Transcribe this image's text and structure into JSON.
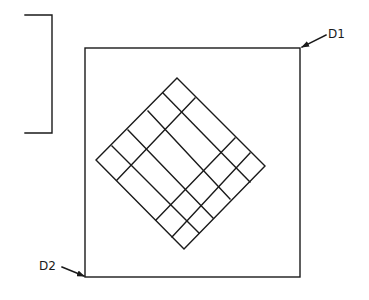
{
  "diagram": {
    "type": "technical-drawing",
    "labels": {
      "d1": "D1",
      "d2": "D2"
    },
    "stroke_color": "#1a1a1a",
    "background": "#ffffff",
    "bracket": {
      "top_y": 15,
      "bottom_y": 133,
      "x": 52,
      "left_x": 25
    },
    "frame": {
      "x": 85,
      "y": 48,
      "width": 215,
      "height": 229
    },
    "diamond": {
      "top": [
        177,
        78
      ],
      "right": [
        265,
        166
      ],
      "bottom": [
        184,
        249
      ],
      "left": [
        96,
        160
      ],
      "down_right_lines": [
        [
          [
            163,
            93
          ],
          [
            250,
            182
          ]
        ],
        [
          [
            148,
            111
          ],
          [
            230,
            199
          ]
        ],
        [
          [
            128,
            130
          ],
          [
            213,
            218
          ]
        ],
        [
          [
            112,
            146
          ],
          [
            199,
            233
          ]
        ]
      ],
      "up_right_lines": [
        [
          [
            117,
            180
          ],
          [
            195,
            98
          ]
        ],
        [
          [
            156,
            220
          ],
          [
            235,
            138
          ]
        ],
        [
          [
            172,
            237
          ],
          [
            250,
            153
          ]
        ]
      ]
    },
    "leaders": [
      {
        "label": "D1",
        "from": [
          326,
          35
        ],
        "to": [
          301,
          48
        ]
      },
      {
        "label": "D2",
        "from": [
          62,
          267
        ],
        "to": [
          85,
          277
        ]
      }
    ]
  }
}
